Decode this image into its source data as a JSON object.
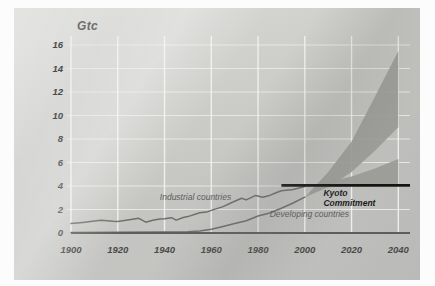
{
  "unit_label": "Gtc",
  "colors": {
    "panel": "#cfcfcc",
    "grid": "#e9e9e6",
    "curve": "#6e6e6c",
    "band": "#9a9a97",
    "kyoto_line": "#141414",
    "axis_text": "#4a4a4a"
  },
  "annotations": {
    "industrial": "Industrial countries",
    "developing": "Developing countries",
    "kyoto_line1": "Kyoto",
    "kyoto_line2": "Commitment"
  },
  "chart_data": {
    "type": "line",
    "title": "",
    "subtitle": "",
    "xlabel": "",
    "ylabel": "Gtc",
    "xlim": [
      1900,
      2045
    ],
    "ylim": [
      0,
      16
    ],
    "xticks": [
      1900,
      1920,
      1940,
      1960,
      1980,
      2000,
      2020,
      2040
    ],
    "yticks": [
      0,
      2,
      4,
      6,
      8,
      10,
      12,
      14,
      16
    ],
    "grid": true,
    "legend": "inline-annotations",
    "series": [
      {
        "name": "Industrial countries",
        "kind": "historic-line",
        "x": [
          1900,
          1905,
          1910,
          1913,
          1918,
          1920,
          1925,
          1929,
          1932,
          1935,
          1938,
          1940,
          1943,
          1945,
          1948,
          1950,
          1955,
          1958,
          1960,
          1965,
          1970,
          1973,
          1975,
          1979,
          1982,
          1985,
          1988,
          1990,
          1995,
          2000
        ],
        "y": [
          0.8,
          0.9,
          1.02,
          1.08,
          1.0,
          0.98,
          1.12,
          1.25,
          0.92,
          1.08,
          1.18,
          1.22,
          1.3,
          1.1,
          1.32,
          1.4,
          1.72,
          1.78,
          1.92,
          2.25,
          2.7,
          2.95,
          2.82,
          3.2,
          3.05,
          3.2,
          3.45,
          3.6,
          3.7,
          3.95
        ]
      },
      {
        "name": "Developing countries",
        "kind": "historic-line",
        "x": [
          1900,
          1920,
          1940,
          1950,
          1955,
          1960,
          1965,
          1970,
          1975,
          1980,
          1985,
          1990,
          1995,
          2000
        ],
        "y": [
          0.05,
          0.06,
          0.08,
          0.1,
          0.18,
          0.32,
          0.55,
          0.8,
          1.05,
          1.45,
          1.7,
          2.1,
          2.55,
          3.05
        ]
      },
      {
        "name": "Developing countries projection",
        "kind": "band",
        "x": [
          2000,
          2010,
          2020,
          2030,
          2040
        ],
        "low": [
          3.05,
          3.9,
          5.2,
          7.0,
          9.0
        ],
        "high": [
          3.05,
          5.2,
          7.8,
          11.6,
          15.5
        ]
      },
      {
        "name": "Industrial countries projection",
        "kind": "band",
        "x": [
          2000,
          2010,
          2020,
          2030,
          2040
        ],
        "low": [
          3.95,
          3.9,
          3.95,
          4.0,
          4.0
        ],
        "high": [
          3.95,
          4.35,
          4.8,
          5.5,
          6.3
        ]
      }
    ],
    "reference_lines": [
      {
        "name": "Kyoto Commitment",
        "orientation": "horizontal",
        "value": 4.05,
        "x_start": 1990,
        "x_end": 2045,
        "style": "thick-black"
      }
    ]
  }
}
